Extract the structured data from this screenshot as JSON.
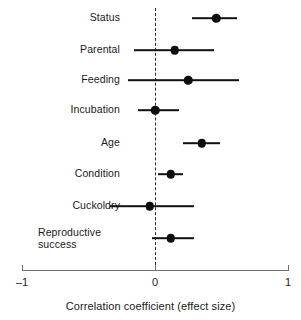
{
  "chart_data": {
    "type": "scatter",
    "subtype": "forest-plot",
    "title": "",
    "xlabel": "Correlation coefficient (effect size)",
    "ylabel": "",
    "xlim": [
      -1,
      1
    ],
    "xticks": [
      -1,
      0,
      1
    ],
    "xticklabels": [
      "–1",
      "0",
      "1"
    ],
    "grid": false,
    "legend": null,
    "reference_line": {
      "x": 0,
      "style": "dashed"
    },
    "categories": [
      "Status",
      "Parental",
      "Feeding",
      "Incubation",
      "Age",
      "Condition",
      "Cuckoldry",
      "Reproductive success"
    ],
    "values": [
      0.46,
      0.15,
      0.25,
      0.0,
      0.35,
      0.12,
      -0.04,
      0.12
    ],
    "ci_low": [
      0.28,
      -0.16,
      -0.2,
      -0.13,
      0.21,
      0.02,
      -0.34,
      -0.02
    ],
    "ci_high": [
      0.62,
      0.44,
      0.63,
      0.18,
      0.49,
      0.21,
      0.29,
      0.29
    ],
    "points": [
      {
        "label": "Status",
        "value": 0.46,
        "ci_low": 0.28,
        "ci_high": 0.62
      },
      {
        "label": "Parental",
        "value": 0.15,
        "ci_low": -0.16,
        "ci_high": 0.44
      },
      {
        "label": "Feeding",
        "value": 0.25,
        "ci_low": -0.2,
        "ci_high": 0.63
      },
      {
        "label": "Incubation",
        "value": 0.0,
        "ci_low": -0.13,
        "ci_high": 0.18
      },
      {
        "label": "Age",
        "value": 0.35,
        "ci_low": 0.21,
        "ci_high": 0.49
      },
      {
        "label": "Condition",
        "value": 0.12,
        "ci_low": 0.02,
        "ci_high": 0.21
      },
      {
        "label": "Cuckoldry",
        "value": -0.04,
        "ci_low": -0.34,
        "ci_high": 0.29
      },
      {
        "label": "Reproductive success",
        "value": 0.12,
        "ci_low": -0.02,
        "ci_high": 0.29
      }
    ]
  },
  "axis": {
    "title": "Correlation coefficient (effect size)",
    "tick_min": "–1",
    "tick_mid": "0",
    "tick_max": "1"
  },
  "rows": [
    {
      "label": "Status"
    },
    {
      "label": "Parental"
    },
    {
      "label": "Feeding"
    },
    {
      "label": "Incubation"
    },
    {
      "label": "Age"
    },
    {
      "label": "Condition"
    },
    {
      "label": "Cuckoldry"
    },
    {
      "label": "Reproductive\nsuccess"
    }
  ],
  "colors": {
    "point": "#0d0d0d",
    "line": "#111111",
    "axis": "#6f6f6f",
    "reference": "#2b2b2b",
    "text": "#1a1a1a",
    "background": "#ffffff"
  }
}
